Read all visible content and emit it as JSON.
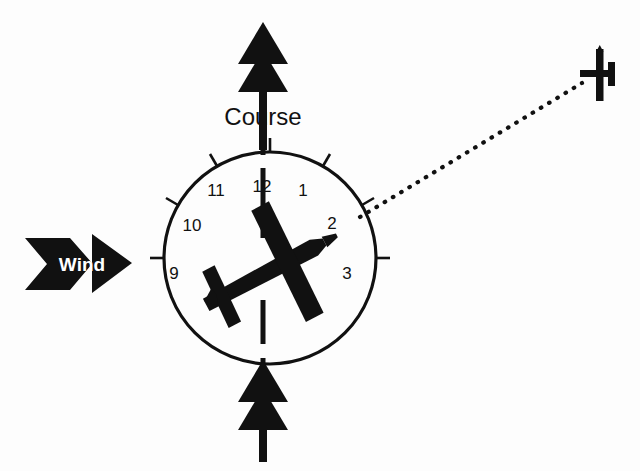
{
  "figure": {
    "background_color": "#fdfdfd",
    "ink_color": "#111111"
  },
  "labels": {
    "course": "Course",
    "wind": "Wind"
  },
  "clock_face": {
    "center_x": 270,
    "center_y": 258,
    "radius": 106,
    "visible_numbers": [
      "9",
      "10",
      "11",
      "12",
      "1",
      "2",
      "3"
    ],
    "numbers": [
      {
        "text": "12",
        "clock_hour": 12,
        "angle_deg": 0,
        "nx": 262,
        "ny": 192,
        "tick": true
      },
      {
        "text": "1",
        "clock_hour": 1,
        "angle_deg": 30,
        "nx": 303,
        "ny": 196,
        "tick": true
      },
      {
        "text": "2",
        "clock_hour": 2,
        "angle_deg": 60,
        "nx": 332,
        "ny": 226,
        "tick": true
      },
      {
        "text": "3",
        "clock_hour": 3,
        "angle_deg": 90,
        "nx": 347,
        "ny": 275,
        "tick": true
      },
      {
        "text": "9",
        "clock_hour": 9,
        "angle_deg": 270,
        "nx": 172,
        "ny": 275,
        "tick": true
      },
      {
        "text": "10",
        "clock_hour": 10,
        "angle_deg": 300,
        "nx": 183,
        "ny": 231,
        "tick": true
      },
      {
        "text": "11",
        "clock_hour": 11,
        "angle_deg": 330,
        "nx": 211,
        "ny": 196,
        "tick": true
      }
    ]
  },
  "symbols": {
    "own_aircraft": {
      "name": "own-aircraft-silhouette",
      "heading_deg": -28,
      "center_x": 268,
      "center_y": 272
    },
    "traffic_aircraft": {
      "name": "traffic-aircraft-silhouette",
      "center_x": 600,
      "center_y": 75,
      "clock_position": "2 o'clock"
    },
    "sight_line": {
      "name": "traffic-sight-line",
      "style": "dotted",
      "from_x": 360,
      "from_y": 216,
      "to_x": 580,
      "to_y": 84
    },
    "course_arrow": {
      "name": "course-arrow",
      "direction": "up",
      "arrowheads": 2,
      "x": 263,
      "top_y": 22,
      "bottom_y": 150
    },
    "lower_course_arrow": {
      "name": "lower-course-arrow",
      "direction": "up",
      "arrowheads": 2,
      "x": 263,
      "top_y": 365,
      "bottom_y": 462
    },
    "wind_arrow": {
      "name": "wind-arrow",
      "direction": "right",
      "x": 25,
      "y": 232,
      "width": 108,
      "height": 63
    }
  }
}
